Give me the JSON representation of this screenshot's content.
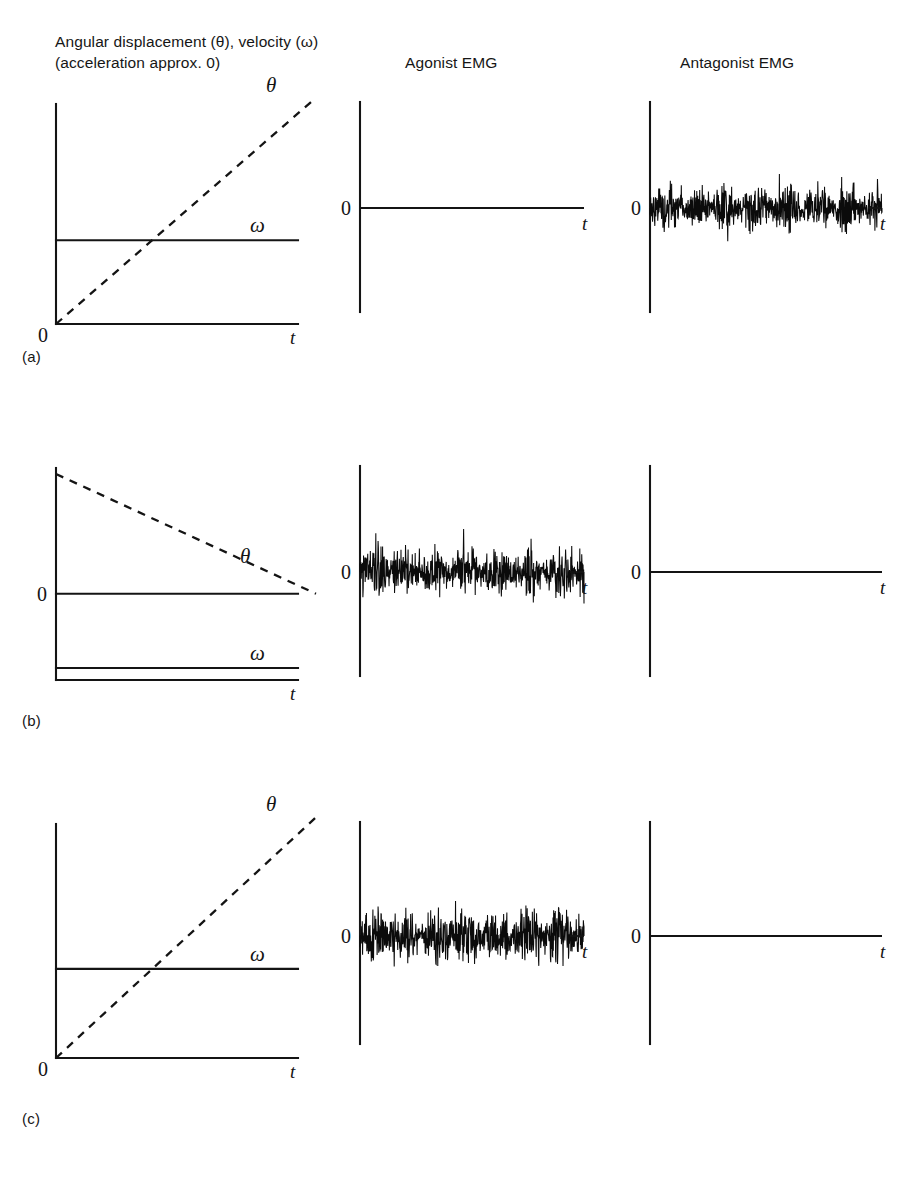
{
  "figure": {
    "column_headers": {
      "kinematics_line1": "Angular displacement (θ), velocity (ω)",
      "kinematics_line2": "(acceleration approx. 0)",
      "agonist": "Agonist EMG",
      "antagonist": "Antagonist EMG"
    },
    "row_labels": {
      "a": "(a)",
      "b": "(b)",
      "c": "(c)"
    },
    "axis_labels": {
      "zero": "0",
      "time": "t",
      "theta": "θ",
      "omega": "ω"
    },
    "ink_color": "#141414",
    "background_color": "#ffffff"
  },
  "chart_data": {
    "type": "line",
    "xlabel": "t",
    "ylabel": "",
    "grid": false,
    "legend": "inline-curve-labels",
    "panels": [
      {
        "row": "(a)",
        "column": "Angular displacement (θ), velocity (ω) (acceleration approx. 0)",
        "kind": "kinematics",
        "zero_label_position": "baseline",
        "series": [
          {
            "name": "θ",
            "style": "dashed",
            "description": "angular displacement rising linearly from 0",
            "x": [
              0,
              1
            ],
            "y": [
              0,
              1.0
            ]
          },
          {
            "name": "ω",
            "style": "solid",
            "description": "constant positive angular velocity",
            "x": [
              0,
              1
            ],
            "y": [
              0.4,
              0.4
            ]
          }
        ],
        "xlim": [
          0,
          1
        ],
        "ylim": [
          0,
          1.05
        ]
      },
      {
        "row": "(a)",
        "column": "Agonist EMG",
        "kind": "emg",
        "active": false,
        "amplitude": 0.0,
        "description": "silent agonist EMG: flat line at zero",
        "zero_label_position": "center"
      },
      {
        "row": "(a)",
        "column": "Antagonist EMG",
        "kind": "emg",
        "active": true,
        "amplitude": 0.62,
        "description": "sustained antagonist EMG burst activity across the whole sweep",
        "zero_label_position": "center",
        "seed": 11
      },
      {
        "row": "(b)",
        "column": "Angular displacement (θ), velocity (ω) (acceleration approx. 0)",
        "kind": "kinematics",
        "zero_label_position": "mid",
        "series": [
          {
            "name": "θ",
            "style": "dashed",
            "description": "angular displacement falling linearly to 0",
            "x": [
              0,
              1
            ],
            "y": [
              1.0,
              0.0
            ]
          },
          {
            "name": "ω",
            "style": "solid",
            "description": "constant negative angular velocity",
            "x": [
              0,
              1
            ],
            "y": [
              -0.62,
              -0.62
            ]
          }
        ],
        "xlim": [
          0,
          1
        ],
        "ylim": [
          -0.72,
          1.05
        ]
      },
      {
        "row": "(b)",
        "column": "Agonist EMG",
        "kind": "emg",
        "active": true,
        "amplitude": 0.66,
        "description": "sustained agonist EMG burst activity across the whole sweep",
        "zero_label_position": "center",
        "seed": 29
      },
      {
        "row": "(b)",
        "column": "Antagonist EMG",
        "kind": "emg",
        "active": false,
        "amplitude": 0.0,
        "description": "silent antagonist EMG: flat line at zero",
        "zero_label_position": "center"
      },
      {
        "row": "(c)",
        "column": "Angular displacement (θ), velocity (ω) (acceleration approx. 0)",
        "kind": "kinematics",
        "zero_label_position": "baseline",
        "series": [
          {
            "name": "θ",
            "style": "dashed",
            "description": "angular displacement rising linearly from 0",
            "x": [
              0,
              1
            ],
            "y": [
              0,
              1.0
            ]
          },
          {
            "name": "ω",
            "style": "solid",
            "description": "constant positive angular velocity",
            "x": [
              0,
              1
            ],
            "y": [
              0.4,
              0.4
            ]
          }
        ],
        "xlim": [
          0,
          1
        ],
        "ylim": [
          0,
          1.05
        ]
      },
      {
        "row": "(c)",
        "column": "Agonist EMG",
        "kind": "emg",
        "active": true,
        "amplitude": 0.72,
        "description": "sustained agonist EMG burst activity across the whole sweep",
        "zero_label_position": "center",
        "seed": 53
      },
      {
        "row": "(c)",
        "column": "Antagonist EMG",
        "kind": "emg",
        "active": false,
        "amplitude": 0.0,
        "description": "silent antagonist EMG: flat line at zero",
        "zero_label_position": "center"
      }
    ]
  }
}
